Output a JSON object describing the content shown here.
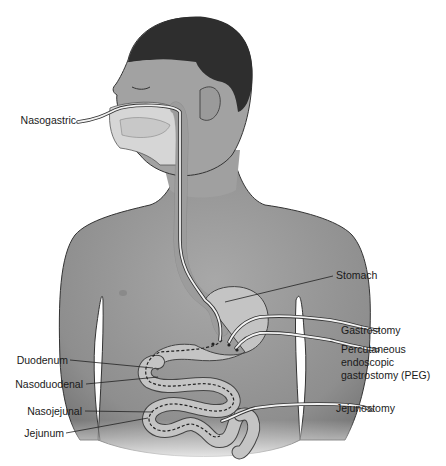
{
  "diagram": {
    "colors": {
      "skin": "#9c9c9c",
      "skin_light": "#b8b8b8",
      "hair": "#2e2e2e",
      "organ": "#c4c4c4",
      "tube": "#f2f2f2",
      "outline": "#333333",
      "background": "#ffffff"
    },
    "labels": {
      "nasogastric": "Nasogastric",
      "stomach": "Stomach",
      "gastrostomy": "Gastrostomy",
      "peg_line1": "Percutaneous",
      "peg_line2": "endoscopic",
      "peg_line3": "gastrostomy (PEG)",
      "duodenum": "Duodenum",
      "nasoduodenal": "Nasoduodenal",
      "nasojejunal": "Nasojejunal",
      "jejunum": "Jejunum",
      "jejunostomy": "Jejunostomy"
    }
  }
}
